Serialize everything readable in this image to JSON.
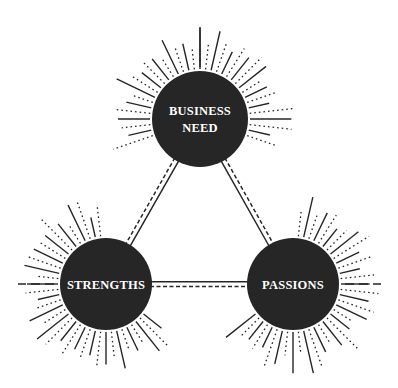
{
  "diagram": {
    "type": "triangle-of-nodes",
    "nodes": [
      {
        "id": "business-need",
        "lines": [
          "BUSINESS",
          "NEED"
        ]
      },
      {
        "id": "strengths",
        "lines": [
          "STRENGTHS"
        ]
      },
      {
        "id": "passions",
        "lines": [
          "PASSIONS"
        ]
      }
    ],
    "edges": [
      {
        "from": "business-need",
        "to": "strengths",
        "style": "solid-and-dashed"
      },
      {
        "from": "business-need",
        "to": "passions",
        "style": "solid-and-dashed"
      },
      {
        "from": "strengths",
        "to": "passions",
        "style": "solid-and-dashed"
      }
    ],
    "decoration": "sunburst-rays",
    "colors": {
      "node_fill": "#262626",
      "node_text": "#ffffff",
      "line": "#262626",
      "background": "#ffffff"
    }
  }
}
